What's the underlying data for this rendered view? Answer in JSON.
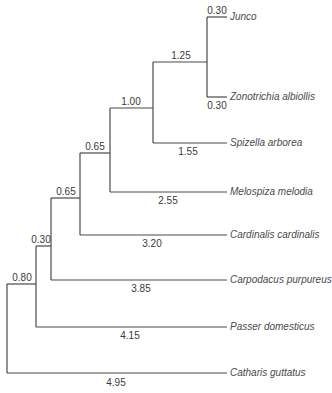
{
  "diagram": {
    "type": "phylogenetic-tree",
    "taxa": [
      {
        "name": "Junco",
        "branch_length": "0.30"
      },
      {
        "name": "Zonotrichia albiollis",
        "branch_length": "0.30"
      },
      {
        "name": "Spizella arborea",
        "branch_length": "1.55"
      },
      {
        "name": "Melospiza melodia",
        "branch_length": "2.55"
      },
      {
        "name": "Cardinalis cardinalis",
        "branch_length": "3.20"
      },
      {
        "name": "Carpodacus purpureus",
        "branch_length": "3.85"
      },
      {
        "name": "Passer domesticus",
        "branch_length": "4.15"
      },
      {
        "name": "Catharis guttatus",
        "branch_length": "4.95"
      }
    ],
    "internal_branches": [
      {
        "label": "1.25",
        "node": "Junco+Zonotrichia"
      },
      {
        "label": "1.00",
        "node": "+Spizella"
      },
      {
        "label": "0.65",
        "node": "+Melospiza"
      },
      {
        "label": "0.65",
        "node": "+Cardinalis"
      },
      {
        "label": "0.30",
        "node": "+Carpodacus"
      },
      {
        "label": "0.80",
        "node": "+Passer"
      }
    ]
  }
}
